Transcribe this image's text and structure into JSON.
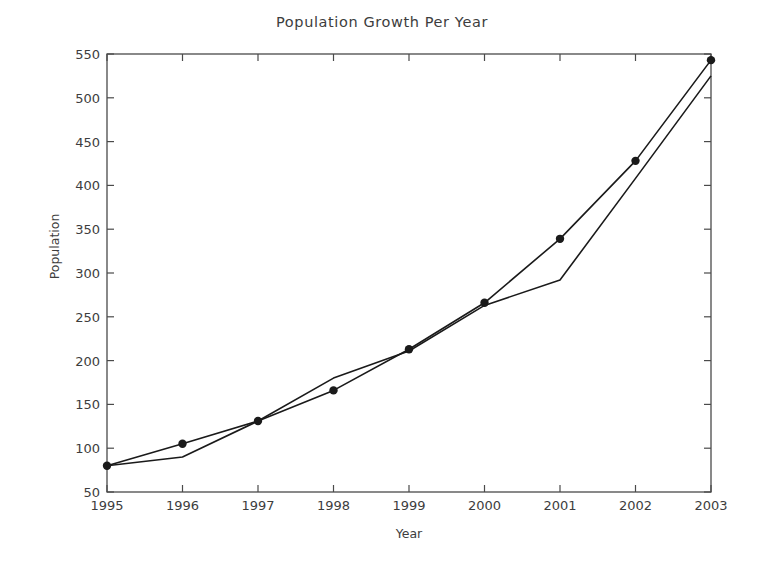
{
  "chart_data": {
    "type": "line",
    "title": "Population Growth Per Year",
    "xlabel": "Year",
    "ylabel": "Population",
    "categories": [
      1995,
      1996,
      1997,
      1998,
      1999,
      2000,
      2001,
      2002,
      2003
    ],
    "x_tick_labels": [
      "1995",
      "1996",
      "1997",
      "1998",
      "1999",
      "2000",
      "2001",
      "2002",
      "2003"
    ],
    "y_tick_labels": [
      "50",
      "100",
      "150",
      "200",
      "250",
      "300",
      "350",
      "400",
      "450",
      "500",
      "550"
    ],
    "y_ticks": [
      50,
      100,
      150,
      200,
      250,
      300,
      350,
      400,
      450,
      500,
      550
    ],
    "xlim": [
      1995,
      2003
    ],
    "ylim": [
      50,
      550
    ],
    "grid": false,
    "legend": null,
    "series": [
      {
        "name": "observed",
        "marker": "circle",
        "color": "#1a1a1a",
        "values": [
          80,
          105,
          131,
          166,
          213,
          266,
          339,
          428,
          543
        ]
      },
      {
        "name": "trend",
        "marker": "none",
        "color": "#1a1a1a",
        "values": [
          80,
          90,
          131,
          180,
          211,
          263,
          292,
          408,
          525
        ]
      }
    ]
  },
  "figure": {
    "background_color": "#ffffff",
    "axes_color": "#4a4a4a",
    "text_color": "#3d3d3d"
  }
}
